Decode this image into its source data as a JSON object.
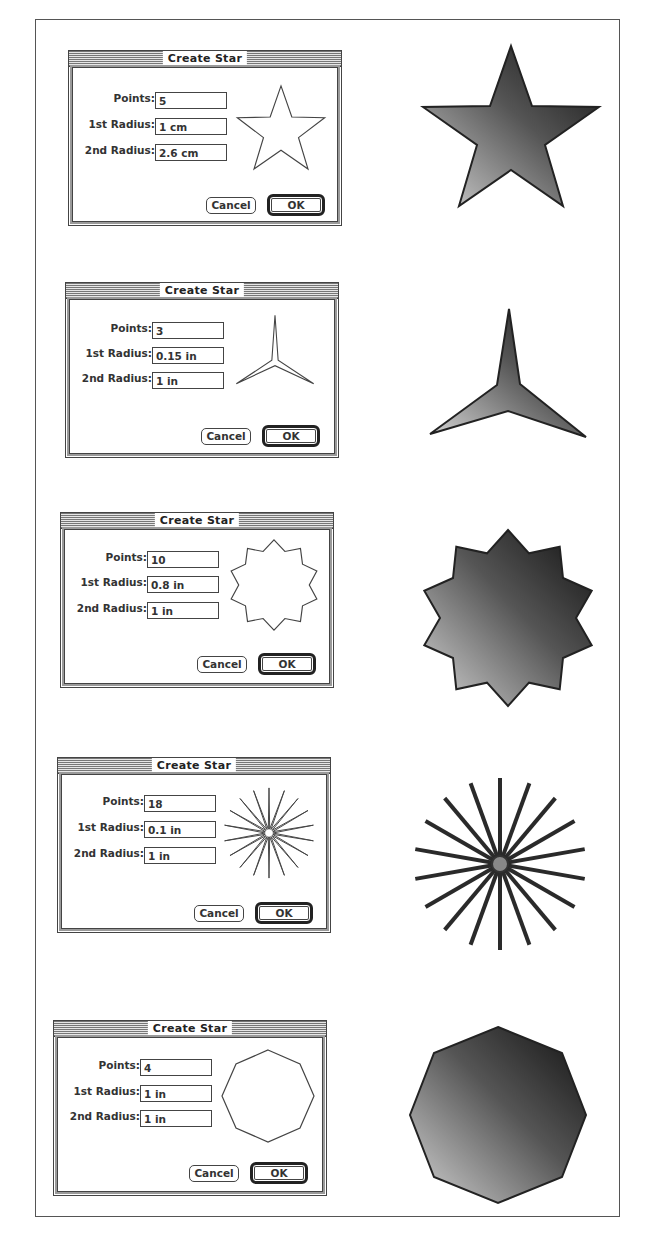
{
  "dialogs": [
    {
      "title": "Create Star",
      "points_label": "Points:",
      "points_value": "5",
      "radius1_label": "1st Radius:",
      "radius1_value": "1 cm",
      "radius2_label": "2nd Radius:",
      "radius2_value": "2.6 cm",
      "cancel_label": "Cancel",
      "ok_label": "OK",
      "shape": "five-point-star"
    },
    {
      "title": "Create Star",
      "points_label": "Points:",
      "points_value": "3",
      "radius1_label": "1st Radius:",
      "radius1_value": "0.15 in",
      "radius2_label": "2nd Radius:",
      "radius2_value": "1 in",
      "cancel_label": "Cancel",
      "ok_label": "OK",
      "shape": "three-point-star"
    },
    {
      "title": "Create Star",
      "points_label": "Points:",
      "points_value": "10",
      "radius1_label": "1st Radius:",
      "radius1_value": "0.8 in",
      "radius2_label": "2nd Radius:",
      "radius2_value": "1 in",
      "cancel_label": "Cancel",
      "ok_label": "OK",
      "shape": "ten-point-star"
    },
    {
      "title": "Create Star",
      "points_label": "Points:",
      "points_value": "18",
      "radius1_label": "1st Radius:",
      "radius1_value": "0.1 in",
      "radius2_label": "2nd Radius:",
      "radius2_value": "1 in",
      "cancel_label": "Cancel",
      "ok_label": "OK",
      "shape": "eighteen-point-starburst"
    },
    {
      "title": "Create Star",
      "points_label": "Points:",
      "points_value": "4",
      "radius1_label": "1st Radius:",
      "radius1_value": "1 in",
      "radius2_label": "2nd Radius:",
      "radius2_value": "1 in",
      "cancel_label": "Cancel",
      "ok_label": "OK",
      "shape": "octagon"
    }
  ],
  "colors": {
    "gradient_dark": "#1a1a1a",
    "gradient_light": "#c8c8c8",
    "outline": "#222222"
  }
}
